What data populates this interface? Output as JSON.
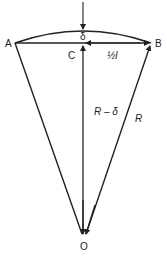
{
  "diagram": {
    "points": {
      "A": {
        "label": "A",
        "x": 15,
        "y": 43
      },
      "B": {
        "label": "B",
        "x": 151,
        "y": 43
      },
      "C": {
        "label": "C",
        "x": 83,
        "y": 43
      },
      "O": {
        "label": "O",
        "x": 84,
        "y": 236
      }
    },
    "labels": {
      "delta": "δ",
      "half_chord": "½l",
      "r_minus_delta": "R – δ",
      "radius": "R"
    },
    "colors": {
      "stroke": "#222222",
      "background": "#ffffff"
    }
  }
}
